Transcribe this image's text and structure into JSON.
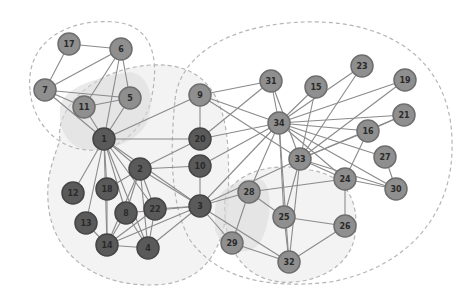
{
  "diagram": {
    "type": "network-graph",
    "colors": {
      "dark_node": "#5a5a5a",
      "light_node": "#8f8f8f",
      "edge": "#8a8a8a",
      "hull_outline": "#b5b5b5"
    },
    "nodes": [
      {
        "id": "1",
        "label": "1",
        "x": 104,
        "y": 139,
        "group": "dark"
      },
      {
        "id": "2",
        "label": "2",
        "x": 140,
        "y": 169,
        "group": "dark"
      },
      {
        "id": "3",
        "label": "3",
        "x": 200,
        "y": 206,
        "group": "dark"
      },
      {
        "id": "4",
        "label": "4",
        "x": 148,
        "y": 248,
        "group": "dark"
      },
      {
        "id": "5",
        "label": "5",
        "x": 130,
        "y": 98,
        "group": "light"
      },
      {
        "id": "6",
        "label": "6",
        "x": 121,
        "y": 49,
        "group": "light"
      },
      {
        "id": "7",
        "label": "7",
        "x": 45,
        "y": 90,
        "group": "light"
      },
      {
        "id": "8",
        "label": "8",
        "x": 126,
        "y": 213,
        "group": "dark"
      },
      {
        "id": "9",
        "label": "9",
        "x": 200,
        "y": 95,
        "group": "light"
      },
      {
        "id": "10",
        "label": "10",
        "x": 200,
        "y": 166,
        "group": "dark"
      },
      {
        "id": "11",
        "label": "11",
        "x": 84,
        "y": 107,
        "group": "light"
      },
      {
        "id": "12",
        "label": "12",
        "x": 73,
        "y": 193,
        "group": "dark"
      },
      {
        "id": "13",
        "label": "13",
        "x": 86,
        "y": 223,
        "group": "dark"
      },
      {
        "id": "14",
        "label": "14",
        "x": 107,
        "y": 245,
        "group": "dark"
      },
      {
        "id": "15",
        "label": "15",
        "x": 316,
        "y": 87,
        "group": "light"
      },
      {
        "id": "16",
        "label": "16",
        "x": 368,
        "y": 131,
        "group": "light"
      },
      {
        "id": "17",
        "label": "17",
        "x": 69,
        "y": 44,
        "group": "light"
      },
      {
        "id": "18",
        "label": "18",
        "x": 107,
        "y": 189,
        "group": "dark"
      },
      {
        "id": "19",
        "label": "19",
        "x": 405,
        "y": 80,
        "group": "light"
      },
      {
        "id": "20",
        "label": "20",
        "x": 200,
        "y": 139,
        "group": "dark"
      },
      {
        "id": "21",
        "label": "21",
        "x": 404,
        "y": 115,
        "group": "light"
      },
      {
        "id": "22",
        "label": "22",
        "x": 155,
        "y": 209,
        "group": "dark"
      },
      {
        "id": "23",
        "label": "23",
        "x": 362,
        "y": 66,
        "group": "light"
      },
      {
        "id": "24",
        "label": "24",
        "x": 345,
        "y": 179,
        "group": "light"
      },
      {
        "id": "25",
        "label": "25",
        "x": 284,
        "y": 217,
        "group": "light"
      },
      {
        "id": "26",
        "label": "26",
        "x": 345,
        "y": 226,
        "group": "light"
      },
      {
        "id": "27",
        "label": "27",
        "x": 385,
        "y": 157,
        "group": "light"
      },
      {
        "id": "28",
        "label": "28",
        "x": 249,
        "y": 192,
        "group": "light"
      },
      {
        "id": "29",
        "label": "29",
        "x": 232,
        "y": 243,
        "group": "light"
      },
      {
        "id": "30",
        "label": "30",
        "x": 396,
        "y": 189,
        "group": "light"
      },
      {
        "id": "31",
        "label": "31",
        "x": 271,
        "y": 81,
        "group": "light"
      },
      {
        "id": "32",
        "label": "32",
        "x": 289,
        "y": 262,
        "group": "light"
      },
      {
        "id": "33",
        "label": "33",
        "x": 300,
        "y": 159,
        "group": "light"
      },
      {
        "id": "34",
        "label": "34",
        "x": 279,
        "y": 123,
        "group": "light"
      }
    ],
    "edges": [
      [
        "17",
        "6"
      ],
      [
        "17",
        "7"
      ],
      [
        "7",
        "6"
      ],
      [
        "7",
        "5"
      ],
      [
        "7",
        "11"
      ],
      [
        "7",
        "1"
      ],
      [
        "6",
        "11"
      ],
      [
        "6",
        "1"
      ],
      [
        "6",
        "5"
      ],
      [
        "11",
        "5"
      ],
      [
        "11",
        "1"
      ],
      [
        "5",
        "1"
      ],
      [
        "1",
        "9"
      ],
      [
        "1",
        "20"
      ],
      [
        "1",
        "2"
      ],
      [
        "1",
        "12"
      ],
      [
        "1",
        "18"
      ],
      [
        "1",
        "8"
      ],
      [
        "1",
        "13"
      ],
      [
        "1",
        "14"
      ],
      [
        "1",
        "4"
      ],
      [
        "1",
        "22"
      ],
      [
        "1",
        "3"
      ],
      [
        "2",
        "18"
      ],
      [
        "2",
        "8"
      ],
      [
        "2",
        "14"
      ],
      [
        "2",
        "4"
      ],
      [
        "2",
        "22"
      ],
      [
        "2",
        "3"
      ],
      [
        "2",
        "20"
      ],
      [
        "2",
        "10"
      ],
      [
        "18",
        "14"
      ],
      [
        "8",
        "14"
      ],
      [
        "8",
        "4"
      ],
      [
        "13",
        "14"
      ],
      [
        "14",
        "4"
      ],
      [
        "14",
        "3"
      ],
      [
        "4",
        "3"
      ],
      [
        "22",
        "3"
      ],
      [
        "22",
        "4"
      ],
      [
        "14",
        "22"
      ],
      [
        "8",
        "3"
      ],
      [
        "9",
        "20"
      ],
      [
        "9",
        "31"
      ],
      [
        "9",
        "34"
      ],
      [
        "9",
        "33"
      ],
      [
        "20",
        "34"
      ],
      [
        "20",
        "31"
      ],
      [
        "10",
        "34"
      ],
      [
        "10",
        "3"
      ],
      [
        "3",
        "28"
      ],
      [
        "3",
        "29"
      ],
      [
        "3",
        "32"
      ],
      [
        "3",
        "34"
      ],
      [
        "3",
        "33"
      ],
      [
        "31",
        "34"
      ],
      [
        "31",
        "33"
      ],
      [
        "15",
        "34"
      ],
      [
        "15",
        "33"
      ],
      [
        "23",
        "34"
      ],
      [
        "23",
        "33"
      ],
      [
        "19",
        "34"
      ],
      [
        "19",
        "33"
      ],
      [
        "21",
        "34"
      ],
      [
        "21",
        "33"
      ],
      [
        "16",
        "34"
      ],
      [
        "16",
        "33"
      ],
      [
        "27",
        "34"
      ],
      [
        "27",
        "30"
      ],
      [
        "30",
        "34"
      ],
      [
        "30",
        "33"
      ],
      [
        "30",
        "24"
      ],
      [
        "24",
        "34"
      ],
      [
        "24",
        "33"
      ],
      [
        "24",
        "26"
      ],
      [
        "24",
        "28"
      ],
      [
        "28",
        "34"
      ],
      [
        "28",
        "29"
      ],
      [
        "25",
        "28"
      ],
      [
        "25",
        "26"
      ],
      [
        "25",
        "32"
      ],
      [
        "26",
        "32"
      ],
      [
        "29",
        "32"
      ],
      [
        "32",
        "34"
      ],
      [
        "32",
        "33"
      ],
      [
        "25",
        "34"
      ],
      [
        "25",
        "33"
      ],
      [
        "16",
        "24"
      ],
      [
        "21",
        "16"
      ]
    ]
  }
}
